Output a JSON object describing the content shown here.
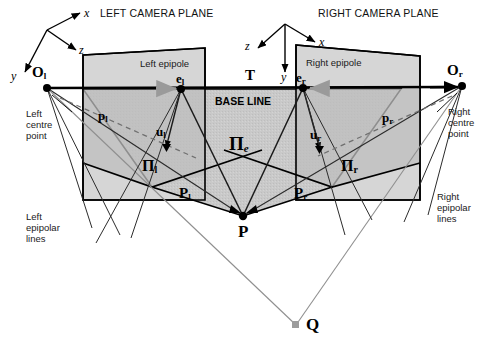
{
  "figure": {
    "title_left": "LEFT CAMERA PLANE",
    "title_right": "RIGHT CAMERA PLANE",
    "baseline_label": "BASE LINE",
    "translation_label": "T",
    "colors": {
      "background": "#ffffff",
      "plane_light": "#d4d4d4",
      "plane_mid": "#c2c2c2",
      "plane_dark": "#b4b4b4",
      "stroke": "#000000",
      "gray_line": "#8c8c8c",
      "text": "#000000"
    }
  },
  "axes": {
    "left": {
      "x": "x",
      "y": "y",
      "z": "z"
    },
    "right": {
      "x": "x",
      "y": "y",
      "z": "z"
    }
  },
  "labels": {
    "left_optical_centre": "O",
    "left_optical_centre_sub": "l",
    "right_optical_centre": "O",
    "right_optical_centre_sub": "r",
    "left_epipole_point": "e",
    "left_epipole_point_sub": "l",
    "right_epipole_point": "e",
    "right_epipole_point_sub": "r",
    "left_epipole_caption": "Left epipole",
    "right_epipole_caption": "Right epipole",
    "left_image_point": "p",
    "left_image_point_sub": "l",
    "right_image_point": "p",
    "right_image_point_sub": "r",
    "left_ray_vector": "u",
    "left_ray_vector_sub": "l",
    "right_ray_vector": "u",
    "right_ray_vector_sub": "r",
    "left_image_plane": "Π",
    "left_image_plane_sub": "l",
    "right_image_plane": "Π",
    "right_image_plane_sub": "r",
    "epipolar_plane": "Π",
    "epipolar_plane_sub": "e",
    "left_projection": "P",
    "left_projection_sub": "l",
    "right_projection": "P",
    "right_projection_sub": "r",
    "scene_point": "P",
    "second_point": "Q",
    "left_centre_point": "Left\ncentre\npoint",
    "right_centre_point": "Right\ncentre\npoint",
    "left_epipolar_lines": "Left\nepipolar\nlines",
    "right_epipolar_lines": "Right\nepipolar\nlines"
  },
  "geometry": {
    "left_camera_centre": [
      47,
      88
    ],
    "right_camera_centre": [
      462,
      86
    ],
    "left_epipole": [
      181,
      89
    ],
    "right_epipole": [
      303,
      88
    ],
    "scene_point_P": [
      243,
      216
    ],
    "second_point_Q": [
      296,
      325
    ],
    "left_plane_quad": "83,55 205,48 205,200 83,200",
    "right_plane_quad": "296,45 420,56 420,200 296,200"
  }
}
